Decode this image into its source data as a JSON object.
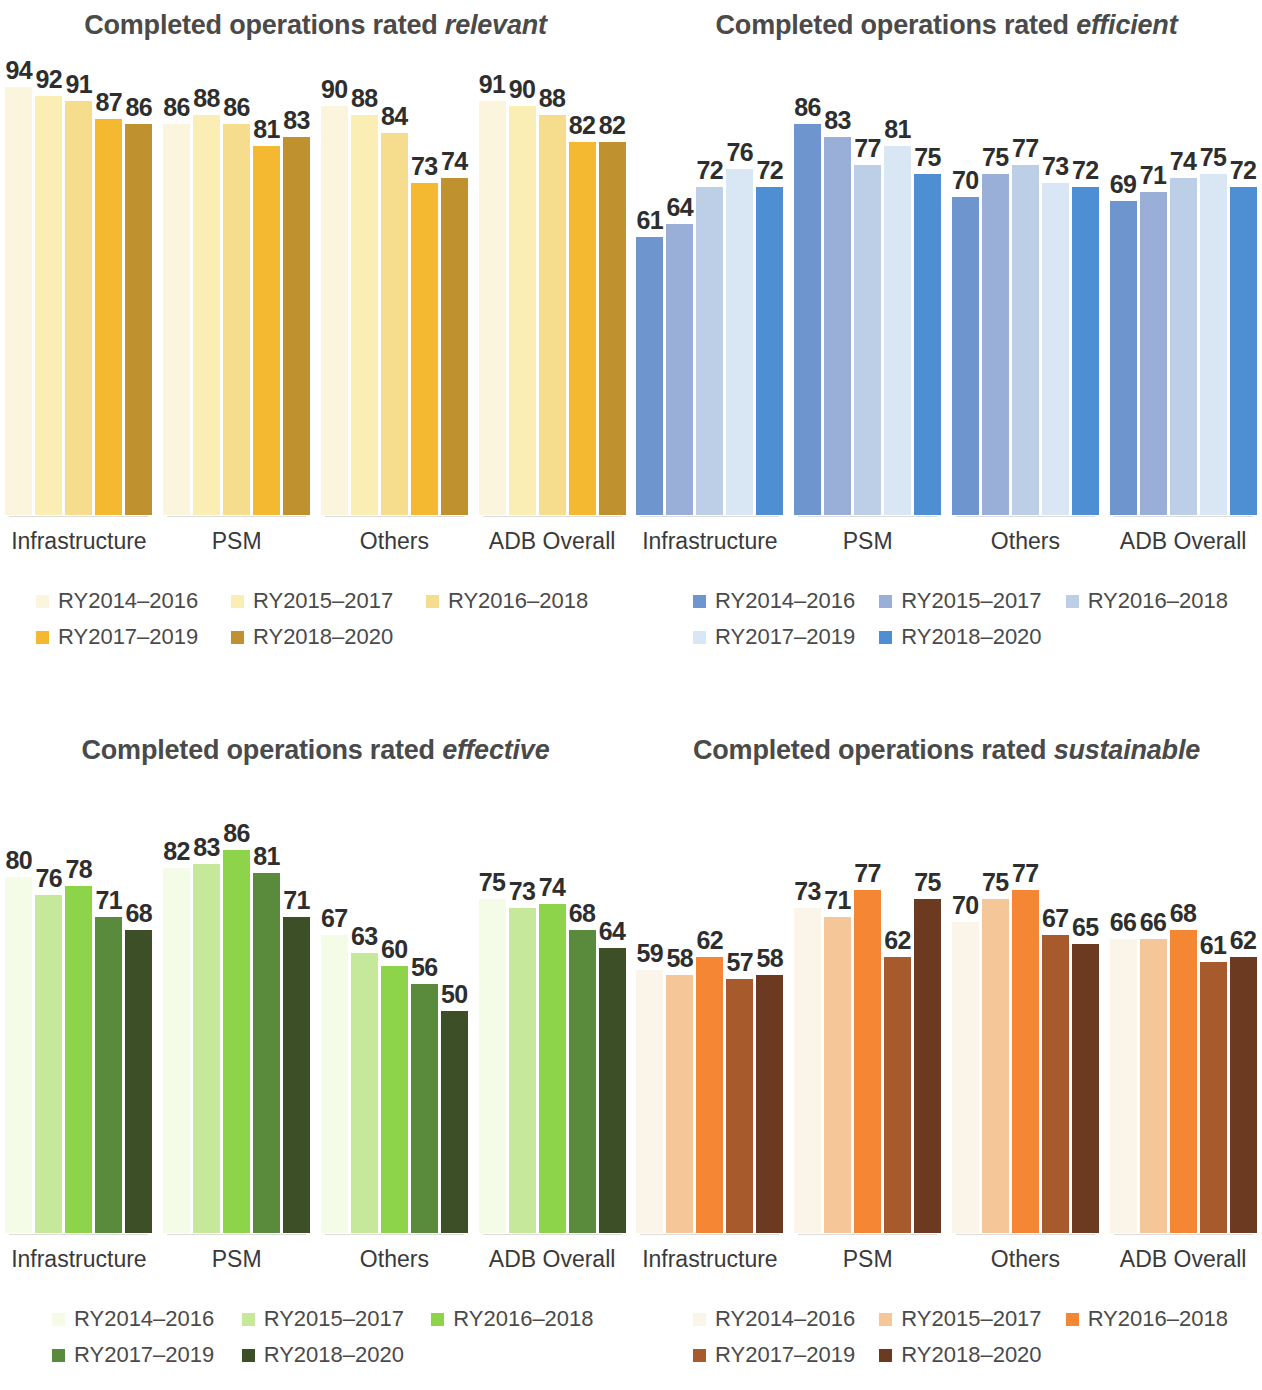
{
  "series_labels": [
    "RY2014–2016",
    "RY2015–2017",
    "RY2016–2018",
    "RY2017–2019",
    "RY2018–2020"
  ],
  "categories": [
    "Infrastructure",
    "PSM",
    "Others",
    "ADB Overall"
  ],
  "panels": [
    {
      "id": "relevant",
      "title_prefix": "Completed operations rated ",
      "title_em": "relevant",
      "palette": [
        "#fbf5dd",
        "#fbeeb4",
        "#f6dd8e",
        "#f5b831",
        "#bf912f"
      ]
    },
    {
      "id": "efficient",
      "title_prefix": "Completed operations rated ",
      "title_em": "efficient",
      "palette": [
        "#6e95cd",
        "#9aafd8",
        "#bccfe6",
        "#d9e6f3",
        "#4e8ed3"
      ]
    },
    {
      "id": "effective",
      "title_prefix": "Completed operations rated ",
      "title_em": "effective",
      "palette": [
        "#f4fbe7",
        "#c6e89a",
        "#8dd44a",
        "#5a8a3c",
        "#3d4f26"
      ]
    },
    {
      "id": "sustainable",
      "title_prefix": "Completed operations rated ",
      "title_em": "sustainable",
      "palette": [
        "#fbf4e8",
        "#f5c697",
        "#f58634",
        "#a75b2c",
        "#6b3a21"
      ]
    }
  ],
  "chart_data": [
    {
      "type": "bar",
      "title": "Completed operations rated relevant",
      "xlabel": "",
      "ylabel": "",
      "ylim": [
        0,
        100
      ],
      "grid": false,
      "legend_position": "bottom",
      "categories": [
        "Infrastructure",
        "PSM",
        "Others",
        "ADB Overall"
      ],
      "series": [
        {
          "name": "RY2014–2016",
          "values": [
            94,
            86,
            90,
            91
          ],
          "color": "#fbf5dd"
        },
        {
          "name": "RY2015–2017",
          "values": [
            92,
            88,
            88,
            90
          ],
          "color": "#fbeeb4"
        },
        {
          "name": "RY2016–2018",
          "values": [
            91,
            86,
            84,
            88
          ],
          "color": "#f6dd8e"
        },
        {
          "name": "RY2017–2019",
          "values": [
            87,
            81,
            73,
            82
          ],
          "color": "#f5b831"
        },
        {
          "name": "RY2018–2020",
          "values": [
            86,
            83,
            74,
            82
          ],
          "color": "#bf912f"
        }
      ]
    },
    {
      "type": "bar",
      "title": "Completed operations rated efficient",
      "xlabel": "",
      "ylabel": "",
      "ylim": [
        0,
        100
      ],
      "grid": false,
      "legend_position": "bottom",
      "categories": [
        "Infrastructure",
        "PSM",
        "Others",
        "ADB Overall"
      ],
      "series": [
        {
          "name": "RY2014–2016",
          "values": [
            61,
            86,
            70,
            69
          ],
          "color": "#6e95cd"
        },
        {
          "name": "RY2015–2017",
          "values": [
            64,
            83,
            75,
            71
          ],
          "color": "#9aafd8"
        },
        {
          "name": "RY2016–2018",
          "values": [
            72,
            77,
            77,
            74
          ],
          "color": "#bccfe6"
        },
        {
          "name": "RY2017–2019",
          "values": [
            76,
            81,
            73,
            75
          ],
          "color": "#d9e6f3"
        },
        {
          "name": "RY2018–2020",
          "values": [
            72,
            75,
            72,
            72
          ],
          "color": "#4e8ed3"
        }
      ]
    },
    {
      "type": "bar",
      "title": "Completed operations rated effective",
      "xlabel": "",
      "ylabel": "",
      "ylim": [
        0,
        100
      ],
      "grid": false,
      "legend_position": "bottom",
      "categories": [
        "Infrastructure",
        "PSM",
        "Others",
        "ADB Overall"
      ],
      "series": [
        {
          "name": "RY2014–2016",
          "values": [
            80,
            82,
            67,
            75
          ],
          "color": "#f4fbe7"
        },
        {
          "name": "RY2015–2017",
          "values": [
            76,
            83,
            63,
            73
          ],
          "color": "#c6e89a"
        },
        {
          "name": "RY2016–2018",
          "values": [
            78,
            86,
            60,
            74
          ],
          "color": "#8dd44a"
        },
        {
          "name": "RY2017–2019",
          "values": [
            71,
            81,
            56,
            68
          ],
          "color": "#5a8a3c"
        },
        {
          "name": "RY2018–2020",
          "values": [
            68,
            71,
            50,
            64
          ],
          "color": "#3d4f26"
        }
      ]
    },
    {
      "type": "bar",
      "title": "Completed operations rated sustainable",
      "xlabel": "",
      "ylabel": "",
      "ylim": [
        0,
        100
      ],
      "grid": false,
      "legend_position": "bottom",
      "categories": [
        "Infrastructure",
        "PSM",
        "Others",
        "ADB Overall"
      ],
      "series": [
        {
          "name": "RY2014–2016",
          "values": [
            59,
            73,
            70,
            66
          ],
          "color": "#fbf4e8"
        },
        {
          "name": "RY2015–2017",
          "values": [
            58,
            71,
            75,
            66
          ],
          "color": "#f5c697"
        },
        {
          "name": "RY2016–2018",
          "values": [
            62,
            77,
            77,
            68
          ],
          "color": "#f58634"
        },
        {
          "name": "RY2017–2019",
          "values": [
            57,
            62,
            67,
            61
          ],
          "color": "#a75b2c"
        },
        {
          "name": "RY2018–2020",
          "values": [
            58,
            75,
            65,
            62
          ],
          "color": "#6b3a21"
        }
      ]
    }
  ]
}
